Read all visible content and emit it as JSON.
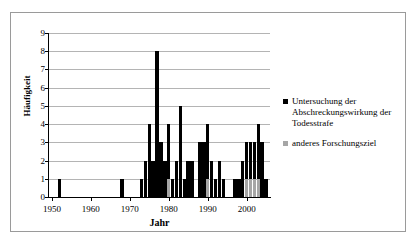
{
  "chart_data": {
    "type": "bar",
    "stacked": true,
    "title": "",
    "xlabel": "Jahr",
    "ylabel": "Häufigkeit",
    "xlim": [
      1949,
      2006
    ],
    "ylim": [
      0,
      9
    ],
    "yticks": [
      0,
      1,
      2,
      3,
      4,
      5,
      6,
      7,
      8,
      9
    ],
    "xticks": [
      1950,
      1960,
      1970,
      1980,
      1990,
      2000
    ],
    "xtick_labels": [
      "1950",
      "1960",
      "1970",
      "1980",
      "1990",
      "2000"
    ],
    "grid": "horizontal",
    "legend_position": "right",
    "colors": {
      "series_main": "#000000",
      "series_other": "#a6a6a6",
      "gridline": "#b4b4b4",
      "axis": "#000000",
      "frame": "#9a9a9a",
      "background": "#ffffff"
    },
    "series": [
      {
        "name": "Untersuchung der Abschreckungswirkung der Todesstrafe",
        "color": "#000000",
        "values": [
          {
            "x": 1952,
            "y": 1
          },
          {
            "x": 1968,
            "y": 1
          },
          {
            "x": 1973,
            "y": 1
          },
          {
            "x": 1974,
            "y": 2
          },
          {
            "x": 1975,
            "y": 4
          },
          {
            "x": 1976,
            "y": 2
          },
          {
            "x": 1977,
            "y": 8
          },
          {
            "x": 1978,
            "y": 3
          },
          {
            "x": 1979,
            "y": 2
          },
          {
            "x": 1980,
            "y": 3
          },
          {
            "x": 1981,
            "y": 1
          },
          {
            "x": 1982,
            "y": 2
          },
          {
            "x": 1983,
            "y": 5
          },
          {
            "x": 1984,
            "y": 1
          },
          {
            "x": 1985,
            "y": 2
          },
          {
            "x": 1986,
            "y": 2
          },
          {
            "x": 1988,
            "y": 3
          },
          {
            "x": 1989,
            "y": 3
          },
          {
            "x": 1990,
            "y": 3
          },
          {
            "x": 1991,
            "y": 2
          },
          {
            "x": 1992,
            "y": 1
          },
          {
            "x": 1993,
            "y": 2
          },
          {
            "x": 1994,
            "y": 1
          },
          {
            "x": 1997,
            "y": 1
          },
          {
            "x": 1998,
            "y": 1
          },
          {
            "x": 1999,
            "y": 2
          },
          {
            "x": 2000,
            "y": 2
          },
          {
            "x": 2001,
            "y": 2
          },
          {
            "x": 2002,
            "y": 2
          },
          {
            "x": 2003,
            "y": 3
          },
          {
            "x": 2004,
            "y": 3
          },
          {
            "x": 2005,
            "y": 1
          }
        ]
      },
      {
        "name": "anderes Forschungsziel",
        "color": "#a6a6a6",
        "values": [
          {
            "x": 1980,
            "y": 1
          },
          {
            "x": 1990,
            "y": 1
          },
          {
            "x": 2000,
            "y": 1
          },
          {
            "x": 2001,
            "y": 1
          },
          {
            "x": 2002,
            "y": 1
          },
          {
            "x": 2003,
            "y": 1
          }
        ]
      }
    ],
    "totals": [
      {
        "x": 1952,
        "total": 1
      },
      {
        "x": 1968,
        "total": 1
      },
      {
        "x": 1973,
        "total": 1
      },
      {
        "x": 1974,
        "total": 2
      },
      {
        "x": 1975,
        "total": 4
      },
      {
        "x": 1976,
        "total": 2
      },
      {
        "x": 1977,
        "total": 8
      },
      {
        "x": 1978,
        "total": 3
      },
      {
        "x": 1979,
        "total": 2
      },
      {
        "x": 1980,
        "total": 4
      },
      {
        "x": 1981,
        "total": 1
      },
      {
        "x": 1982,
        "total": 2
      },
      {
        "x": 1983,
        "total": 5
      },
      {
        "x": 1984,
        "total": 1
      },
      {
        "x": 1985,
        "total": 2
      },
      {
        "x": 1986,
        "total": 2
      },
      {
        "x": 1988,
        "total": 3
      },
      {
        "x": 1989,
        "total": 3
      },
      {
        "x": 1990,
        "total": 4
      },
      {
        "x": 1991,
        "total": 2
      },
      {
        "x": 1992,
        "total": 1
      },
      {
        "x": 1993,
        "total": 2
      },
      {
        "x": 1994,
        "total": 1
      },
      {
        "x": 1997,
        "total": 1
      },
      {
        "x": 1998,
        "total": 1
      },
      {
        "x": 1999,
        "total": 2
      },
      {
        "x": 2000,
        "total": 3
      },
      {
        "x": 2001,
        "total": 3
      },
      {
        "x": 2002,
        "total": 3
      },
      {
        "x": 2003,
        "total": 4
      },
      {
        "x": 2004,
        "total": 3
      },
      {
        "x": 2005,
        "total": 1
      }
    ]
  },
  "legend": {
    "entries": [
      {
        "label": "Untersuchung der Abschreckungswirkung der Todesstrafe",
        "swatch": "series-main-swatch"
      },
      {
        "label": "anderes Forschungsziel",
        "swatch": "series-other-swatch"
      }
    ]
  },
  "axes": {
    "y_title": "Häufigkeit",
    "x_title": "Jahr"
  }
}
